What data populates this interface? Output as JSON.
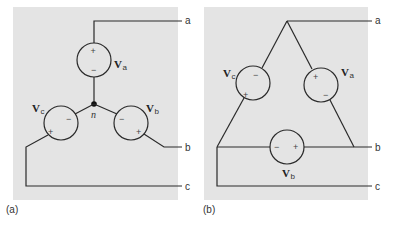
{
  "colors": {
    "panel_bg": "#e4e4e4",
    "wire": "#2a2a2a"
  },
  "panel_a": {
    "caption": "(a)",
    "neutral_label": "n",
    "terminals": {
      "a": "a",
      "b": "b",
      "c": "c"
    },
    "sources": [
      {
        "id": "va",
        "symbol": "V",
        "subscript": "a",
        "plus": "+",
        "minus": "−"
      },
      {
        "id": "vb",
        "symbol": "V",
        "subscript": "b",
        "plus": "+",
        "minus": "−"
      },
      {
        "id": "vc",
        "symbol": "V",
        "subscript": "c",
        "plus": "+",
        "minus": "−"
      }
    ]
  },
  "panel_b": {
    "caption": "(b)",
    "terminals": {
      "a": "a",
      "b": "b",
      "c": "c"
    },
    "sources": [
      {
        "id": "va",
        "symbol": "V",
        "subscript": "a",
        "plus": "+",
        "minus": "−"
      },
      {
        "id": "vb",
        "symbol": "V",
        "subscript": "b",
        "plus": "+",
        "minus": "−"
      },
      {
        "id": "vc",
        "symbol": "V",
        "subscript": "c",
        "plus": "+",
        "minus": "−"
      }
    ]
  }
}
